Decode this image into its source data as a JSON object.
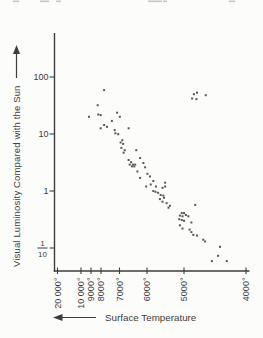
{
  "figure": {
    "y_axis_title": "Visual Luminosity Compared with the Sun",
    "x_axis_title": "Surface Temperature",
    "colors": {
      "ink": "#3e3e3e",
      "point": "#585858",
      "background": "#fcfcfb",
      "artifact": "#c6c6c6"
    },
    "top_edge_marks": [
      [
        13,
        6
      ],
      [
        40,
        9
      ],
      [
        56,
        5
      ],
      [
        148,
        14
      ],
      [
        163,
        4
      ],
      [
        229,
        6
      ]
    ]
  },
  "chart_data": {
    "type": "scatter",
    "title": "",
    "xlabel": "Surface Temperature",
    "ylabel": "Visual Luminosity Compared with the Sun",
    "x_axis": {
      "unit": "degrees",
      "direction": "reversed",
      "range": [
        20000,
        4000
      ]
    },
    "y_axis": {
      "scale": "log",
      "range": [
        0.05,
        500
      ]
    },
    "grid": "off",
    "legend": "none",
    "x_ticks": [
      {
        "label": "20 000°",
        "value": 20000,
        "px": 57.5
      },
      {
        "label": "10 000°",
        "value": 10000,
        "px": 81
      },
      {
        "label": "9000°",
        "value": 9000,
        "px": 91
      },
      {
        "label": "8000°",
        "value": 8000,
        "px": 101
      },
      {
        "label": "7000°",
        "value": 7000,
        "px": 119.5
      },
      {
        "label": "6000°",
        "value": 6000,
        "px": 147
      },
      {
        "label": "5000°",
        "value": 5000,
        "px": 184
      },
      {
        "label": "4000°",
        "value": 4000,
        "px": 246
      }
    ],
    "y_ticks": [
      {
        "label": "100",
        "value": 100,
        "py": 77
      },
      {
        "label": "10",
        "value": 10,
        "py": 134
      },
      {
        "label": "1",
        "value": 1,
        "py": 191
      },
      {
        "label": "1/10",
        "value": 0.1,
        "py": 248
      }
    ],
    "points": [
      [
        7830,
        59
      ],
      [
        8330,
        32
      ],
      [
        9200,
        20
      ],
      [
        8270,
        22
      ],
      [
        8030,
        21.5
      ],
      [
        7130,
        23.6
      ],
      [
        6990,
        20
      ],
      [
        7410,
        17
      ],
      [
        7830,
        14.4
      ],
      [
        7680,
        13.4
      ],
      [
        8030,
        12.6
      ],
      [
        7260,
        11.7
      ],
      [
        7220,
        10.3
      ],
      [
        6670,
        12.6
      ],
      [
        7070,
        9.9
      ],
      [
        6900,
        7.8
      ],
      [
        6960,
        7.1
      ],
      [
        6870,
        6.7
      ],
      [
        6930,
        5.7
      ],
      [
        6810,
        5.2
      ],
      [
        6850,
        4.7
      ],
      [
        6390,
        5.2
      ],
      [
        6250,
        3.8
      ],
      [
        6670,
        3.5
      ],
      [
        6580,
        3.2
      ],
      [
        6630,
        2.9
      ],
      [
        6510,
        2.9
      ],
      [
        6550,
        2.7
      ],
      [
        6460,
        2.7
      ],
      [
        6430,
        2.9
      ],
      [
        6130,
        3.1
      ],
      [
        6070,
        2.6
      ],
      [
        6350,
        2.2
      ],
      [
        5990,
        2.0
      ],
      [
        5920,
        1.8
      ],
      [
        6250,
        1.7
      ],
      [
        5830,
        1.5
      ],
      [
        5900,
        1.3
      ],
      [
        6030,
        1.2
      ],
      [
        5760,
        1.2
      ],
      [
        5510,
        1.4
      ],
      [
        5510,
        1.2
      ],
      [
        5830,
        1.0
      ],
      [
        5770,
        0.97
      ],
      [
        5700,
        0.93
      ],
      [
        5630,
        0.85
      ],
      [
        5560,
        0.83
      ],
      [
        5580,
        1.14
      ],
      [
        5540,
        0.76
      ],
      [
        5650,
        0.72
      ],
      [
        5580,
        0.65
      ],
      [
        5470,
        0.61
      ],
      [
        5380,
        0.55
      ],
      [
        5420,
        0.51
      ],
      [
        4820,
        0.57
      ],
      [
        5060,
        0.41
      ],
      [
        5000,
        0.41
      ],
      [
        5110,
        0.37
      ],
      [
        5040,
        0.36
      ],
      [
        4970,
        0.38
      ],
      [
        4930,
        0.36
      ],
      [
        5130,
        0.32
      ],
      [
        5060,
        0.31
      ],
      [
        5000,
        0.3
      ],
      [
        4880,
        0.28
      ],
      [
        5110,
        0.25
      ],
      [
        5040,
        0.22
      ],
      [
        4910,
        0.21
      ],
      [
        4880,
        0.19
      ],
      [
        4850,
        0.17
      ],
      [
        4790,
        0.165
      ],
      [
        4690,
        0.14
      ],
      [
        4660,
        0.13
      ],
      [
        4420,
        0.105
      ],
      [
        4450,
        0.073
      ],
      [
        4550,
        0.059
      ],
      [
        4310,
        0.059
      ],
      [
        4870,
        42
      ],
      [
        4840,
        50
      ],
      [
        4790,
        53
      ],
      [
        4800,
        41
      ],
      [
        4650,
        48
      ]
    ]
  }
}
